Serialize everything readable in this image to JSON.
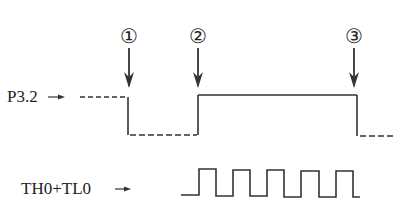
{
  "diagram": {
    "type": "timing-diagram",
    "signals": [
      {
        "name": "P3.2",
        "label": "P3.2",
        "description": "External gate input: dashed high before ①, dashed low between ① and ②, solid high from ② to ③, dashed low after ③"
      },
      {
        "name": "TH0+TL0",
        "label": "TH0+TL0",
        "description": "Timer counter pulse train counting while P3.2 is high (5 pulses)"
      }
    ],
    "markers": [
      {
        "id": "1",
        "label": "①"
      },
      {
        "id": "2",
        "label": "②"
      },
      {
        "id": "3",
        "label": "③"
      }
    ],
    "pulse_count": 5,
    "colors": {
      "line": "#333333",
      "text": "#222222",
      "background": "#ffffff"
    }
  }
}
